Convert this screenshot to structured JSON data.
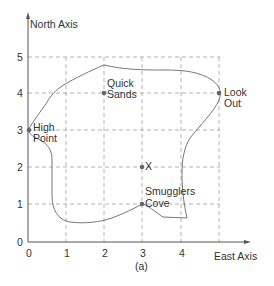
{
  "figure": {
    "caption": "(a)",
    "x_axis_label": "East Axis",
    "y_axis_label": "North Axis",
    "x_ticks": [
      "0",
      "1",
      "2",
      "3",
      "4"
    ],
    "y_ticks": [
      "0",
      "1",
      "2",
      "3",
      "4",
      "5"
    ]
  },
  "points": [
    {
      "name": "High Point",
      "line1": "High",
      "line2": "Point",
      "x": 0,
      "y": 3
    },
    {
      "name": "Quick Sands",
      "line1": "Quick",
      "line2": "Sands",
      "x": 2,
      "y": 4
    },
    {
      "name": "Look Out",
      "line1": "Look",
      "line2": "Out",
      "x": 5,
      "y": 4
    },
    {
      "name": "X",
      "line1": "X",
      "x": 3,
      "y": 2
    },
    {
      "name": "Smugglers Cove",
      "line1": "Smugglers",
      "line2": "Cove",
      "x": 3,
      "y": 1
    }
  ],
  "colors": {
    "axis": "#555555",
    "grid": "#999999",
    "outline": "#777777",
    "point": "#666666",
    "text": "#333333"
  }
}
